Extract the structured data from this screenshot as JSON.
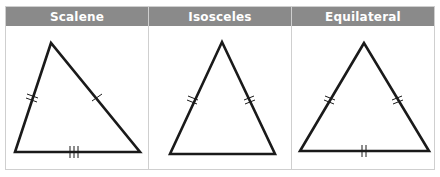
{
  "columns": [
    {
      "label": "Scalene",
      "marks": {
        "left": 2,
        "right": 1,
        "base": 3
      }
    },
    {
      "label": "Isosceles",
      "marks": {
        "left": 2,
        "right": 2,
        "base": 0
      }
    },
    {
      "label": "Equilateral",
      "marks": {
        "left": 2,
        "right": 2,
        "base": 2
      }
    }
  ],
  "colors": {
    "header_bg": "#8a8a8a",
    "header_text": "#ffffff",
    "stroke": "#1a1a1a",
    "border": "#cfcfcf"
  }
}
